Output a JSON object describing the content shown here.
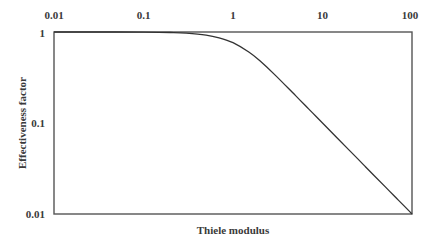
{
  "chart_data": {
    "type": "line",
    "title": "",
    "xlabel": "Thiele modulus",
    "ylabel": "Effectiveness factor",
    "xscale": "log",
    "yscale": "log",
    "xlim": [
      0.01,
      100
    ],
    "ylim": [
      0.01,
      1
    ],
    "x_ticks": [
      "0.01",
      "0.1",
      "1",
      "10",
      "100"
    ],
    "y_ticks": [
      "1",
      "0.1",
      "0.01"
    ],
    "x_axis_position": "top",
    "grid": false,
    "legend": null,
    "series": [
      {
        "name": "Effectiveness factor",
        "x": [
          0.01,
          0.03,
          0.1,
          0.2,
          0.3,
          0.5,
          0.7,
          1,
          1.5,
          2,
          3,
          5,
          7,
          10,
          20,
          30,
          50,
          70,
          100
        ],
        "values": [
          1.0,
          1.0,
          0.997,
          0.987,
          0.971,
          0.924,
          0.863,
          0.762,
          0.603,
          0.482,
          0.332,
          0.2,
          0.143,
          0.1,
          0.05,
          0.0333,
          0.02,
          0.0143,
          0.01
        ]
      }
    ]
  }
}
